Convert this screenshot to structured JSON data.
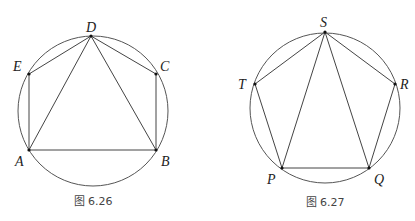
{
  "figures": [
    {
      "caption": "图 6.26",
      "circle": {
        "cx": 93,
        "cy": 111,
        "r": 75
      },
      "points": {
        "D": {
          "x": 91,
          "y": 36,
          "label": "D",
          "lx": 86,
          "ly": 31
        },
        "E": {
          "x": 29,
          "y": 74,
          "label": "E",
          "lx": 12,
          "ly": 70
        },
        "C": {
          "x": 156,
          "y": 74,
          "label": "C",
          "lx": 161,
          "ly": 70
        },
        "A": {
          "x": 29,
          "y": 150,
          "label": "A",
          "lx": 14,
          "ly": 165
        },
        "B": {
          "x": 156,
          "y": 150,
          "label": "B",
          "lx": 161,
          "ly": 165
        }
      },
      "segments": [
        [
          "D",
          "E"
        ],
        [
          "D",
          "C"
        ],
        [
          "E",
          "A"
        ],
        [
          "C",
          "B"
        ],
        [
          "A",
          "B"
        ],
        [
          "D",
          "A"
        ],
        [
          "D",
          "B"
        ]
      ]
    },
    {
      "caption": "图 6.27",
      "circle": {
        "cx": 325,
        "cy": 108,
        "r": 75
      },
      "points": {
        "S": {
          "x": 325,
          "y": 32,
          "label": "S",
          "lx": 320,
          "ly": 26
        },
        "T": {
          "x": 255,
          "y": 84,
          "label": "T",
          "lx": 237,
          "ly": 89
        },
        "R": {
          "x": 395,
          "y": 84,
          "label": "R",
          "lx": 400,
          "ly": 89
        },
        "P": {
          "x": 282,
          "y": 168,
          "label": "P",
          "lx": 265,
          "ly": 183
        },
        "Q": {
          "x": 369,
          "y": 168,
          "label": "Q",
          "lx": 374,
          "ly": 183
        }
      },
      "segments": [
        [
          "S",
          "T"
        ],
        [
          "S",
          "R"
        ],
        [
          "T",
          "P"
        ],
        [
          "R",
          "Q"
        ],
        [
          "P",
          "Q"
        ],
        [
          "S",
          "P"
        ],
        [
          "S",
          "Q"
        ]
      ]
    }
  ],
  "captions": {
    "fig1": "图 6.26",
    "fig2": "图 6.27"
  },
  "labels": {
    "fig1": {
      "A": "A",
      "B": "B",
      "C": "C",
      "D": "D",
      "E": "E"
    },
    "fig2": {
      "P": "P",
      "Q": "Q",
      "R": "R",
      "S": "S",
      "T": "T"
    }
  }
}
